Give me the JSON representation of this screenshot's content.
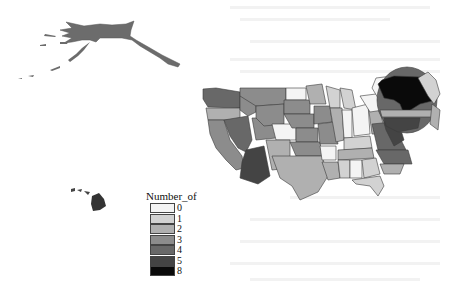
{
  "map": {
    "title": "",
    "regions": [
      {
        "name": "Alaska",
        "class": 3
      },
      {
        "name": "Hawaii",
        "class": 5
      },
      {
        "name": "Contiguous US",
        "class": "mixed"
      }
    ]
  },
  "legend": {
    "title": "Number_of",
    "items": [
      {
        "label": "0",
        "color": "#f4f4f4"
      },
      {
        "label": "1",
        "color": "#d2d2d2"
      },
      {
        "label": "2",
        "color": "#b0b0b0"
      },
      {
        "label": "3",
        "color": "#8c8c8c"
      },
      {
        "label": "4",
        "color": "#686868"
      },
      {
        "label": "5",
        "color": "#444444"
      },
      {
        "label": "8",
        "color": "#0a0a0a"
      }
    ]
  }
}
